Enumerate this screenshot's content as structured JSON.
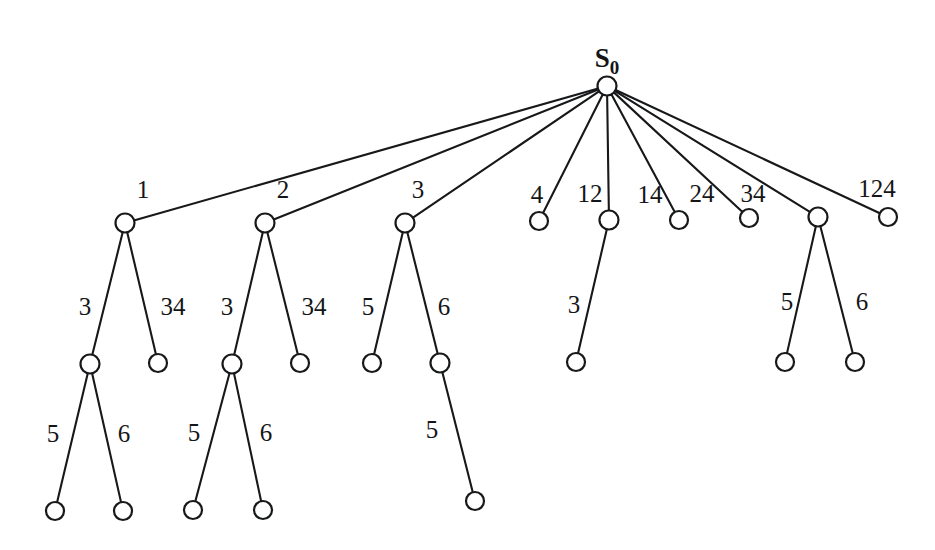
{
  "diagram": {
    "type": "tree",
    "background_color": "#ffffff",
    "stroke_color": "#17181a",
    "node_fill": "#ffffff",
    "root": {
      "id": "s0",
      "label_main": "S",
      "label_sub": "0",
      "x": 607,
      "y": 86,
      "r": 9.5
    },
    "nodes": [
      {
        "id": "n1",
        "x": 125,
        "y": 223,
        "r": 9.5,
        "level": 1
      },
      {
        "id": "n2",
        "x": 265,
        "y": 223,
        "r": 9.5,
        "level": 1
      },
      {
        "id": "n3",
        "x": 405,
        "y": 223,
        "r": 9.5,
        "level": 1
      },
      {
        "id": "n4",
        "x": 539,
        "y": 221,
        "r": 9.0,
        "level": 1
      },
      {
        "id": "n12",
        "x": 609,
        "y": 220,
        "r": 9.5,
        "level": 1
      },
      {
        "id": "n14",
        "x": 679,
        "y": 220,
        "r": 9.0,
        "level": 1
      },
      {
        "id": "n24",
        "x": 749,
        "y": 218,
        "r": 9.0,
        "level": 1
      },
      {
        "id": "n34",
        "x": 818,
        "y": 217,
        "r": 9.5,
        "level": 1
      },
      {
        "id": "n124",
        "x": 888,
        "y": 217,
        "r": 9.0,
        "level": 1
      },
      {
        "id": "n1_3",
        "x": 90,
        "y": 364,
        "r": 9.5,
        "level": 2
      },
      {
        "id": "n1_34",
        "x": 158,
        "y": 363,
        "r": 9.0,
        "level": 2
      },
      {
        "id": "n2_3",
        "x": 232,
        "y": 364,
        "r": 9.5,
        "level": 2
      },
      {
        "id": "n2_34",
        "x": 300,
        "y": 363,
        "r": 9.0,
        "level": 2
      },
      {
        "id": "n3_5",
        "x": 372,
        "y": 363,
        "r": 9.0,
        "level": 2
      },
      {
        "id": "n3_6",
        "x": 440,
        "y": 363,
        "r": 9.5,
        "level": 2
      },
      {
        "id": "n12_3",
        "x": 576,
        "y": 362,
        "r": 9.0,
        "level": 2
      },
      {
        "id": "n34_5",
        "x": 785,
        "y": 362,
        "r": 9.0,
        "level": 2
      },
      {
        "id": "n34_6",
        "x": 855,
        "y": 362,
        "r": 9.0,
        "level": 2
      },
      {
        "id": "n1_3_5",
        "x": 55,
        "y": 511,
        "r": 9.0,
        "level": 3
      },
      {
        "id": "n1_3_6",
        "x": 123,
        "y": 511,
        "r": 9.0,
        "level": 3
      },
      {
        "id": "n2_3_5",
        "x": 193,
        "y": 510,
        "r": 9.0,
        "level": 3
      },
      {
        "id": "n2_3_6",
        "x": 263,
        "y": 510,
        "r": 9.0,
        "level": 3
      },
      {
        "id": "n3_6_5",
        "x": 475,
        "y": 501,
        "r": 9.0,
        "level": 3
      }
    ],
    "edges": [
      {
        "from": "s0",
        "to": "n1",
        "label": "1",
        "lx": 143,
        "ly": 198
      },
      {
        "from": "s0",
        "to": "n2",
        "label": "2",
        "lx": 283,
        "ly": 198
      },
      {
        "from": "s0",
        "to": "n3",
        "label": "3",
        "lx": 418,
        "ly": 198
      },
      {
        "from": "s0",
        "to": "n4",
        "label": "4",
        "lx": 537,
        "ly": 203
      },
      {
        "from": "s0",
        "to": "n12",
        "label": "12",
        "lx": 590,
        "ly": 202
      },
      {
        "from": "s0",
        "to": "n14",
        "label": "14",
        "lx": 650,
        "ly": 203
      },
      {
        "from": "s0",
        "to": "n24",
        "label": "24",
        "lx": 702,
        "ly": 202
      },
      {
        "from": "s0",
        "to": "n34",
        "label": "34",
        "lx": 753,
        "ly": 202
      },
      {
        "from": "s0",
        "to": "n124",
        "label": "124",
        "lx": 877,
        "ly": 197
      },
      {
        "from": "n1",
        "to": "n1_3",
        "label": "3",
        "lx": 85,
        "ly": 315
      },
      {
        "from": "n1",
        "to": "n1_34",
        "label": "34",
        "lx": 173,
        "ly": 315
      },
      {
        "from": "n2",
        "to": "n2_3",
        "label": "3",
        "lx": 227,
        "ly": 315
      },
      {
        "from": "n2",
        "to": "n2_34",
        "label": "34",
        "lx": 314,
        "ly": 315
      },
      {
        "from": "n3",
        "to": "n3_5",
        "label": "5",
        "lx": 368,
        "ly": 315
      },
      {
        "from": "n3",
        "to": "n3_6",
        "label": "6",
        "lx": 444,
        "ly": 315
      },
      {
        "from": "n12",
        "to": "n12_3",
        "label": "3",
        "lx": 574,
        "ly": 313
      },
      {
        "from": "n34",
        "to": "n34_5",
        "label": "5",
        "lx": 787,
        "ly": 310
      },
      {
        "from": "n34",
        "to": "n34_6",
        "label": "6",
        "lx": 862,
        "ly": 310
      },
      {
        "from": "n1_3",
        "to": "n1_3_5",
        "label": "5",
        "lx": 53,
        "ly": 442
      },
      {
        "from": "n1_3",
        "to": "n1_3_6",
        "label": "6",
        "lx": 124,
        "ly": 442
      },
      {
        "from": "n2_3",
        "to": "n2_3_5",
        "label": "5",
        "lx": 194,
        "ly": 441
      },
      {
        "from": "n2_3",
        "to": "n2_3_6",
        "label": "6",
        "lx": 266,
        "ly": 441
      },
      {
        "from": "n3_6",
        "to": "n3_6_5",
        "label": "5",
        "lx": 432,
        "ly": 438
      }
    ]
  }
}
